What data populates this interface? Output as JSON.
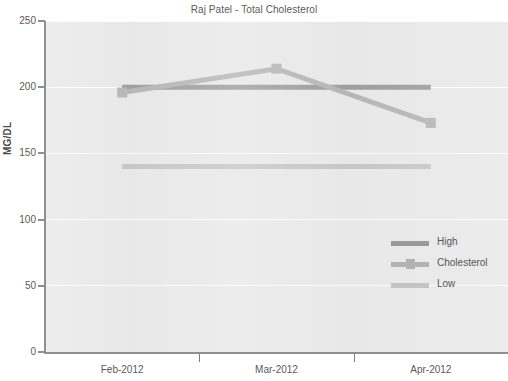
{
  "chart_data": {
    "type": "line",
    "title": "Raj Patel - Total Cholesterol",
    "xlabel": "",
    "ylabel": "MG/DL",
    "categories": [
      "Feb-2012",
      "Mar-2012",
      "Apr-2012"
    ],
    "ylim": [
      0,
      250
    ],
    "yticks": [
      0,
      50,
      100,
      150,
      200,
      250
    ],
    "grid": true,
    "legend_position": "center-right",
    "series": [
      {
        "name": "High",
        "values": [
          200,
          200,
          200
        ],
        "color": "#9a9a9a",
        "marker": "none"
      },
      {
        "name": "Cholesterol",
        "values": [
          196,
          214,
          173
        ],
        "color": "#b3b3b3",
        "marker": "square"
      },
      {
        "name": "Low",
        "values": [
          140,
          140,
          140
        ],
        "color": "#c4c4c4",
        "marker": "none"
      }
    ]
  },
  "axes": {
    "y_label": "MG/DL",
    "y_ticks": [
      "0",
      "50",
      "100",
      "150",
      "200",
      "250"
    ],
    "x_ticks": [
      "Feb-2012",
      "Mar-2012",
      "Apr-2012"
    ]
  },
  "legend": {
    "items": [
      {
        "label": "High"
      },
      {
        "label": "Cholesterol"
      },
      {
        "label": "Low"
      }
    ]
  },
  "colors": {
    "plot_background": "#e7e7e7",
    "page_background": "#ffffff",
    "gridline": "#fbfbfb",
    "axis": "#8f8f8f",
    "text": "#5a5a5a",
    "series_high": "#9a9a9a",
    "series_cholesterol": "#b3b3b3",
    "series_low": "#c4c4c4"
  }
}
